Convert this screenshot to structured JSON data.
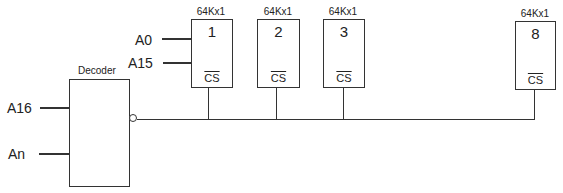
{
  "decoder": {
    "title": "Decoder",
    "inputs": [
      "A16",
      "An"
    ]
  },
  "address_inputs": [
    "A0",
    "A15"
  ],
  "chips": [
    {
      "title": "64Kx1",
      "number": "1",
      "cs_label": "CS"
    },
    {
      "title": "64Kx1",
      "number": "2",
      "cs_label": "CS"
    },
    {
      "title": "64Kx1",
      "number": "3",
      "cs_label": "CS"
    },
    {
      "title": "64Kx1",
      "number": "8",
      "cs_label": "CS"
    }
  ]
}
